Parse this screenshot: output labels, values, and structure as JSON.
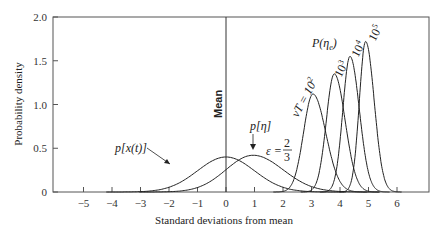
{
  "chart_data": {
    "type": "line",
    "title": "",
    "xlabel": "Standard deviations from mean",
    "ylabel": "Probability density",
    "xlim": [
      -6,
      7.2
    ],
    "ylim": [
      0,
      2.0
    ],
    "x_ticks": [
      -5,
      -4,
      -3,
      -2,
      -1,
      0,
      1,
      2,
      3,
      4,
      5,
      6
    ],
    "x_tick_labels": [
      "−5",
      "−4",
      "−3",
      "−2",
      "−1",
      "0",
      "1",
      "2",
      "3",
      "4",
      "5",
      "6"
    ],
    "y_ticks": [
      0,
      0.5,
      1.0,
      1.5,
      2.0
    ],
    "y_tick_labels": [
      "0",
      "0.5",
      "1.0",
      "1.5",
      "2.0"
    ],
    "grid": false,
    "legend": "none (inline annotations)",
    "mean_line": {
      "x": 0,
      "label": "Mean"
    },
    "series": [
      {
        "name": "p[x(t)]",
        "kind": "gaussian",
        "peak_x": 0.0,
        "peak_y": 0.4,
        "spread": 1.0
      },
      {
        "name": "p[η] (ε = 2/3)",
        "kind": "skewed",
        "peak_x": 0.95,
        "peak_y": 0.42,
        "spread_left": 0.95,
        "spread_right": 1.05
      },
      {
        "name": "νT = 10^2",
        "kind": "skewed",
        "peak_x": 3.05,
        "peak_y": 1.12,
        "spread_left": 0.33,
        "spread_right": 0.45
      },
      {
        "name": "νT = 10^3",
        "kind": "skewed",
        "peak_x": 3.8,
        "peak_y": 1.35,
        "spread_left": 0.28,
        "spread_right": 0.38
      },
      {
        "name": "νT = 10^4",
        "kind": "skewed",
        "peak_x": 4.35,
        "peak_y": 1.55,
        "spread_left": 0.25,
        "spread_right": 0.33
      },
      {
        "name": "νT = 10^5",
        "kind": "skewed",
        "peak_x": 4.9,
        "peak_y": 1.72,
        "spread_left": 0.22,
        "spread_right": 0.3
      }
    ],
    "annotations": [
      {
        "text": "p[x(t)]",
        "x": -1.9,
        "y": 0.55
      },
      {
        "text": "p[η]",
        "x": 0.95,
        "y": 0.78
      },
      {
        "text": "ε = 2/3",
        "x": 1.9,
        "y": 0.45
      },
      {
        "text": "P(ηe)",
        "x": 3.0,
        "y": 1.45
      },
      {
        "text": "νT = 10²",
        "x": 2.6,
        "y": 1.2
      },
      {
        "text": "10³",
        "x": 3.6,
        "y": 1.5
      },
      {
        "text": "10⁴",
        "x": 4.2,
        "y": 1.7
      },
      {
        "text": "10⁵",
        "x": 4.75,
        "y": 1.85
      }
    ]
  },
  "labels": {
    "xlabel": "Standard deviations from mean",
    "ylabel": "Probability density",
    "mean": "Mean",
    "px": "p[x(t)]",
    "peta": "p[η]",
    "eps_prefix": "ε =",
    "eps_num": "2",
    "eps_den": "3",
    "Peta": "P(η",
    "Peta_sub": "e",
    "Peta_close": ")",
    "vt2": "νT = 10",
    "vt2_exp": "2",
    "vt3": "10",
    "vt3_exp": "3",
    "vt4": "10",
    "vt4_exp": "4",
    "vt5": "10",
    "vt5_exp": "5"
  }
}
